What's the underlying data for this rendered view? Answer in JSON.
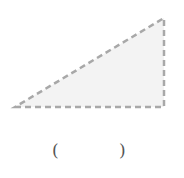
{
  "figure": {
    "shape": "right-triangle",
    "vertices": {
      "bottom_left": [
        15,
        107
      ],
      "bottom_right": [
        164,
        107
      ],
      "top_right": [
        164,
        18
      ]
    },
    "fill_color": "#f3f3f3",
    "stroke_color": "#a8a8a8",
    "stroke_style": "dashed"
  },
  "answer": {
    "open_paren": "(",
    "close_paren": ")",
    "value": ""
  }
}
